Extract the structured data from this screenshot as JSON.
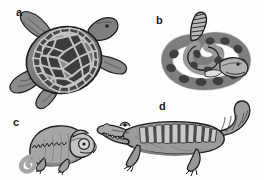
{
  "plate": {
    "title": "Reptile illustration plate",
    "background_color": "#fdfdfd",
    "ink_color": "#1d1d1a",
    "width": 264,
    "height": 180,
    "style": "grayscale line-and-wash scientific illustration"
  },
  "palette": {
    "ink": "#1d1d1d",
    "dark_scute": "#3a3a3a",
    "mid_gray": "#8a8a8a",
    "light_gray": "#b4b4b4",
    "pale_gray": "#cfcfcf",
    "shadow_gray": "#5e5e5e",
    "highlight": "#e2e2e2"
  },
  "figures": [
    {
      "id": "a",
      "label": "a",
      "name": "sea-turtle",
      "common_name": "Sea turtle",
      "group": "Testudines",
      "view": "dorsal",
      "label_x": 16,
      "label_y": 7,
      "features": [
        "carapace",
        "polygonal scutes",
        "four flippers",
        "head"
      ]
    },
    {
      "id": "b",
      "label": "b",
      "name": "rattlesnake",
      "common_name": "Rattlesnake",
      "group": "Squamata (Serpentes)",
      "view": "coiled",
      "label_x": 156,
      "label_y": 16,
      "features": [
        "coiled body",
        "dark blotches",
        "segmented rattle",
        "head"
      ]
    },
    {
      "id": "c",
      "label": "c",
      "name": "chameleon",
      "common_name": "Chameleon",
      "group": "Squamata (Lacertilia)",
      "view": "lateral",
      "label_x": 15,
      "label_y": 119,
      "features": [
        "casque",
        "dorsal crest",
        "prehensile coiled tail",
        "turreted eye"
      ]
    },
    {
      "id": "d",
      "label": "d",
      "name": "crocodilian",
      "common_name": "Crocodile",
      "group": "Crocodylia",
      "view": "lateral",
      "label_x": 159,
      "label_y": 101,
      "features": [
        "elongated snout",
        "armored dorsal scutes",
        "clawed feet",
        "banded tail"
      ]
    }
  ]
}
